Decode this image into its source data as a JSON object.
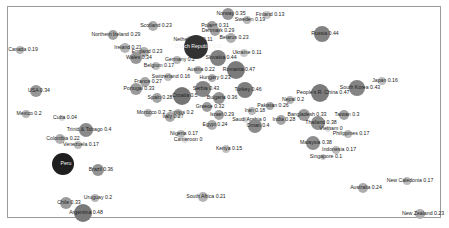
{
  "chart_data": {
    "type": "scatter",
    "title": "",
    "xlabel": "",
    "ylabel": "",
    "grid": false,
    "legend": "none",
    "encoding": "bubble size and gray shade scale with the value",
    "points": [
      {
        "label": "Norway",
        "value": 0.35,
        "x": 228,
        "y": 14,
        "r": 6
      },
      {
        "label": "Finland",
        "value": 0.13,
        "x": 267,
        "y": 15,
        "r": 4
      },
      {
        "label": "Sweden",
        "value": 0.19,
        "x": 247,
        "y": 20,
        "r": 4
      },
      {
        "label": "Scotland",
        "value": 0.23,
        "x": 153,
        "y": 26,
        "r": 5
      },
      {
        "label": "Poland",
        "value": 0.31,
        "x": 212,
        "y": 26,
        "r": 5
      },
      {
        "label": "Denmark",
        "value": 0.29,
        "x": 215,
        "y": 31,
        "r": 5
      },
      {
        "label": "Northern Ireland",
        "value": 0.29,
        "x": 113,
        "y": 35,
        "r": 5
      },
      {
        "label": "Belarus",
        "value": 0.23,
        "x": 231,
        "y": 38,
        "r": 5
      },
      {
        "label": "Netherlands",
        "value": 0.11,
        "x": 190,
        "y": 40,
        "r": 4
      },
      {
        "label": "Czech Republic",
        "value": 0.81,
        "x": 196,
        "y": 47,
        "r": 12
      },
      {
        "label": "Ireland",
        "value": 0.21,
        "x": 125,
        "y": 48,
        "r": 5
      },
      {
        "label": "England",
        "value": 0.23,
        "x": 144,
        "y": 52,
        "r": 5
      },
      {
        "label": "Ukraine",
        "value": 0.11,
        "x": 244,
        "y": 53,
        "r": 4
      },
      {
        "label": "Wales",
        "value": 0.34,
        "x": 136,
        "y": 58,
        "r": 6
      },
      {
        "label": "Germany",
        "value": 0.2,
        "x": 177,
        "y": 60,
        "r": 4
      },
      {
        "label": "Slovakia",
        "value": 0.44,
        "x": 218,
        "y": 58,
        "r": 8
      },
      {
        "label": "Belgium",
        "value": 0.17,
        "x": 156,
        "y": 66,
        "r": 4
      },
      {
        "label": "Austria",
        "value": 0.22,
        "x": 198,
        "y": 70,
        "r": 4
      },
      {
        "label": "Romania",
        "value": 0.47,
        "x": 236,
        "y": 70,
        "r": 9
      },
      {
        "label": "Switzerland",
        "value": 0.16,
        "x": 168,
        "y": 77,
        "r": 4
      },
      {
        "label": "Hungary",
        "value": 0.23,
        "x": 212,
        "y": 78,
        "r": 4
      },
      {
        "label": "France",
        "value": 0.27,
        "x": 145,
        "y": 82,
        "r": 5
      },
      {
        "label": "Portugal",
        "value": 0.33,
        "x": 136,
        "y": 89,
        "r": 6
      },
      {
        "label": "Serbia",
        "value": 0.43,
        "x": 203,
        "y": 89,
        "r": 8
      },
      {
        "label": "Turkey",
        "value": 0.46,
        "x": 245,
        "y": 90,
        "r": 8
      },
      {
        "label": "Croatia",
        "value": 0.5,
        "x": 182,
        "y": 96,
        "r": 9
      },
      {
        "label": "Spain",
        "value": 0.28,
        "x": 157,
        "y": 98,
        "r": 5
      },
      {
        "label": "Bulgaria",
        "value": 0.36,
        "x": 219,
        "y": 98,
        "r": 6
      },
      {
        "label": "Greece",
        "value": 0.32,
        "x": 207,
        "y": 107,
        "r": 5
      },
      {
        "label": "Morocco",
        "value": 0.2,
        "x": 148,
        "y": 113,
        "r": 4
      },
      {
        "label": "Tunisia",
        "value": 0.2,
        "x": 178,
        "y": 113,
        "r": 4
      },
      {
        "label": "Italy",
        "value": 0.27,
        "x": 170,
        "y": 117,
        "r": 5
      },
      {
        "label": "Israel",
        "value": 0.29,
        "x": 219,
        "y": 115,
        "r": 5
      },
      {
        "label": "Pakistan",
        "value": 0.26,
        "x": 270,
        "y": 106,
        "r": 4
      },
      {
        "label": "Nepal",
        "value": 0.2,
        "x": 290,
        "y": 100,
        "r": 4
      },
      {
        "label": "Iran",
        "value": 0.18,
        "x": 252,
        "y": 111,
        "r": 4
      },
      {
        "label": "Saudi Arabia",
        "value": 0,
        "x": 246,
        "y": 120,
        "r": 3
      },
      {
        "label": "Oman",
        "value": 0.4,
        "x": 255,
        "y": 126,
        "r": 7
      },
      {
        "label": "India",
        "value": 0.28,
        "x": 281,
        "y": 120,
        "r": 5
      },
      {
        "label": "Egypt",
        "value": 0.24,
        "x": 212,
        "y": 125,
        "r": 5
      },
      {
        "label": "Nigeria",
        "value": 0.17,
        "x": 181,
        "y": 134,
        "r": 4
      },
      {
        "label": "Cameroon",
        "value": 0,
        "x": 185,
        "y": 140,
        "r": 3
      },
      {
        "label": "Kenya",
        "value": 0.15,
        "x": 226,
        "y": 149,
        "r": 4
      },
      {
        "label": "South Africa",
        "value": 0.21,
        "x": 203,
        "y": 197,
        "r": 5
      },
      {
        "label": "Russia",
        "value": 0.44,
        "x": 322,
        "y": 34,
        "r": 8
      },
      {
        "label": "Japan",
        "value": 0.16,
        "x": 382,
        "y": 81,
        "r": 4
      },
      {
        "label": "South Korea",
        "value": 0.43,
        "x": 357,
        "y": 88,
        "r": 8
      },
      {
        "label": "People's R. China",
        "value": 0.47,
        "x": 320,
        "y": 93,
        "r": 9
      },
      {
        "label": "Bangladesh",
        "value": 0.33,
        "x": 304,
        "y": 115,
        "r": 6
      },
      {
        "label": "Taiwan",
        "value": 0.3,
        "x": 344,
        "y": 115,
        "r": 5
      },
      {
        "label": "Thailand",
        "value": 0.38,
        "x": 318,
        "y": 123,
        "r": 7
      },
      {
        "label": "Vietnam",
        "value": 0,
        "x": 328,
        "y": 129,
        "r": 3
      },
      {
        "label": "Philippines",
        "value": 0.17,
        "x": 348,
        "y": 134,
        "r": 4
      },
      {
        "label": "Malaysia",
        "value": 0.38,
        "x": 313,
        "y": 143,
        "r": 7
      },
      {
        "label": "Indonesia",
        "value": 0.17,
        "x": 336,
        "y": 150,
        "r": 4
      },
      {
        "label": "Singapore",
        "value": 0.1,
        "x": 323,
        "y": 157,
        "r": 3
      },
      {
        "label": "New Caledonia",
        "value": 0.17,
        "x": 407,
        "y": 181,
        "r": 4
      },
      {
        "label": "Australia",
        "value": 0.24,
        "x": 363,
        "y": 188,
        "r": 5
      },
      {
        "label": "New Zealand",
        "value": 0.23,
        "x": 420,
        "y": 214,
        "r": 5
      },
      {
        "label": "Canada",
        "value": 0.19,
        "x": 20,
        "y": 50,
        "r": 4
      },
      {
        "label": "USA",
        "value": 0.34,
        "x": 36,
        "y": 91,
        "r": 6
      },
      {
        "label": "Mexico",
        "value": 0.2,
        "x": 26,
        "y": 114,
        "r": 4
      },
      {
        "label": "Cuba",
        "value": 0.04,
        "x": 62,
        "y": 118,
        "r": 3
      },
      {
        "label": "Trinid.& Tobago",
        "value": 0.4,
        "x": 86,
        "y": 130,
        "r": 7
      },
      {
        "label": "Colombia",
        "value": 0.22,
        "x": 60,
        "y": 139,
        "r": 5
      },
      {
        "label": "Venezuela",
        "value": 0.17,
        "x": 78,
        "y": 145,
        "r": 4
      },
      {
        "label": "Peru",
        "value": null,
        "x": 63,
        "y": 164,
        "r": 11
      },
      {
        "label": "Brazil",
        "value": 0.36,
        "x": 98,
        "y": 170,
        "r": 6
      },
      {
        "label": "Uruguay",
        "value": 0.2,
        "x": 95,
        "y": 198,
        "r": 4
      },
      {
        "label": "Chile",
        "value": 0.33,
        "x": 66,
        "y": 203,
        "r": 6
      },
      {
        "label": "Argentina",
        "value": 0.48,
        "x": 83,
        "y": 213,
        "r": 9
      }
    ]
  }
}
